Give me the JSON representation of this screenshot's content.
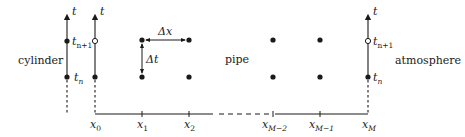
{
  "diagram": {
    "regions": {
      "left": "cylinder",
      "middle": "pipe",
      "right": "atmosphere"
    },
    "time_axis_label": "t",
    "time_levels": {
      "upper": {
        "base": "t",
        "sub": "n+1"
      },
      "lower": {
        "base": "t",
        "sub": "n"
      }
    },
    "space_nodes": [
      {
        "base": "x",
        "sub": "0"
      },
      {
        "base": "x",
        "sub": "1"
      },
      {
        "base": "x",
        "sub": "2"
      },
      {
        "base": "x",
        "sub": "M−2"
      },
      {
        "base": "x",
        "sub": "M−1"
      },
      {
        "base": "x",
        "sub": "M"
      }
    ],
    "steps": {
      "space": "Δx",
      "time": "Δt"
    },
    "colors": {
      "ink": "#1a1a1a",
      "background": "#ffffff"
    }
  }
}
